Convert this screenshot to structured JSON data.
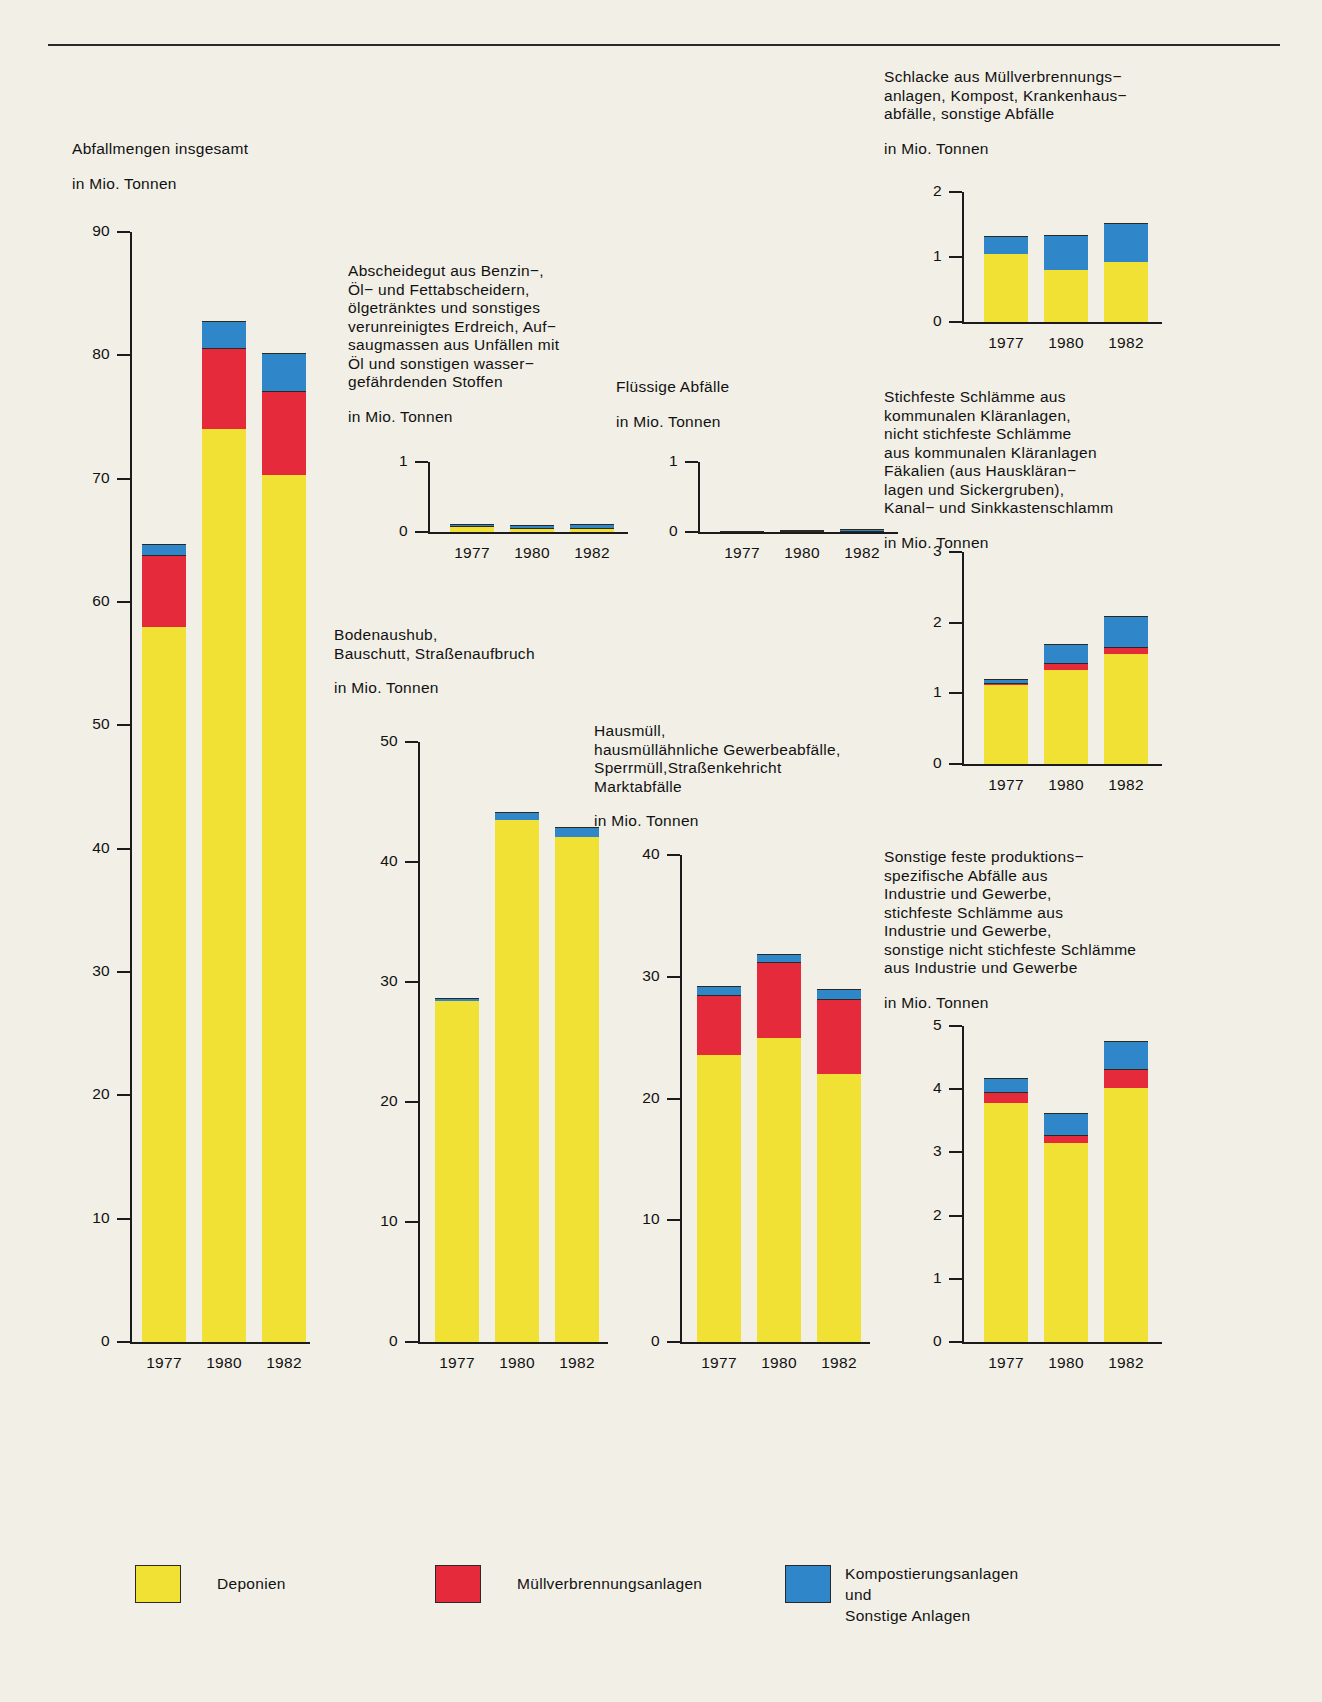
{
  "figure": {
    "unit_label": "in Mio. Tonnen",
    "years": [
      "1977",
      "1980",
      "1982"
    ]
  },
  "legend": {
    "items": [
      {
        "name": "deponien",
        "label": "Deponien",
        "color": "#f2e135"
      },
      {
        "name": "muellverbrennungsanlagen",
        "label": "Müllverbrennungsanlagen",
        "color": "#e42a3b"
      },
      {
        "name": "kompostierungsanlagen",
        "label": "Kompostierungsanlagen und\nSonstige Anlagen",
        "color": "#2f86c8"
      }
    ]
  },
  "chart_data": [
    {
      "id": "abfallmengen-insgesamt",
      "type": "bar",
      "stacked": true,
      "title": "Abfallmengen insgesamt",
      "ylabel": "in Mio. Tonnen",
      "categories": [
        "1977",
        "1980",
        "1982"
      ],
      "ylim": [
        0,
        90
      ],
      "yticks": [
        0,
        10,
        20,
        30,
        40,
        50,
        60,
        70,
        80,
        90
      ],
      "series": [
        {
          "name": "Deponien",
          "color": "#f2e135",
          "values": [
            58.0,
            74.0,
            70.3
          ]
        },
        {
          "name": "Müllverbrennungsanlagen",
          "color": "#e42a3b",
          "values": [
            5.8,
            6.6,
            6.8
          ]
        },
        {
          "name": "Kompostierungsanlagen und Sonstige Anlagen",
          "color": "#2f86c8",
          "values": [
            0.9,
            2.2,
            3.1
          ]
        }
      ],
      "totals": [
        64.7,
        82.8,
        80.2
      ]
    },
    {
      "id": "abscheidegut",
      "type": "bar",
      "stacked": true,
      "title": "Abscheidegut aus Benzin−,\nÖl− und Fettabscheidern,\nölgetränktes und sonstiges\nverunreinigtes Erdreich, Auf−\nsaugmassen aus Unfällen mit\nÖl und sonstigen wasser−\ngefährdenden Stoffen",
      "ylabel": "in Mio. Tonnen",
      "categories": [
        "1977",
        "1980",
        "1982"
      ],
      "ylim": [
        0,
        1
      ],
      "yticks": [
        0,
        1
      ],
      "series": [
        {
          "name": "Deponien",
          "color": "#f2e135",
          "values": [
            0.085,
            0.055,
            0.055
          ]
        },
        {
          "name": "Müllverbrennungsanlagen",
          "color": "#e42a3b",
          "values": [
            0.005,
            0.005,
            0.005
          ]
        },
        {
          "name": "Kompostierungsanlagen und Sonstige Anlagen",
          "color": "#2f86c8",
          "values": [
            0.02,
            0.04,
            0.05
          ]
        }
      ],
      "totals": [
        0.11,
        0.1,
        0.11
      ]
    },
    {
      "id": "fluessige-abfaelle",
      "type": "bar",
      "stacked": true,
      "title": "Flüssige Abfälle",
      "ylabel": "in Mio. Tonnen",
      "categories": [
        "1977",
        "1980",
        "1982"
      ],
      "ylim": [
        0,
        1
      ],
      "yticks": [
        0,
        1
      ],
      "series": [
        {
          "name": "Deponien",
          "color": "#f2e135",
          "values": [
            0.01,
            0.01,
            0.01
          ]
        },
        {
          "name": "Müllverbrennungsanlagen",
          "color": "#e42a3b",
          "values": [
            0.005,
            0.005,
            0.005
          ]
        },
        {
          "name": "Kompostierungsanlagen und Sonstige Anlagen",
          "color": "#2f86c8",
          "values": [
            0.005,
            0.01,
            0.03
          ]
        }
      ],
      "totals": [
        0.02,
        0.025,
        0.045
      ]
    },
    {
      "id": "schlacke-kompost-krankenhaus",
      "type": "bar",
      "stacked": true,
      "title": "Schlacke aus Müllverbrennungs−\nanlagen, Kompost, Krankenhaus−\nabfälle, sonstige Abfälle",
      "ylabel": "in Mio. Tonnen",
      "categories": [
        "1977",
        "1980",
        "1982"
      ],
      "ylim": [
        0,
        2
      ],
      "yticks": [
        0,
        1,
        2
      ],
      "series": [
        {
          "name": "Deponien",
          "color": "#f2e135",
          "values": [
            1.05,
            0.8,
            0.92
          ]
        },
        {
          "name": "Müllverbrennungsanlagen",
          "color": "#e42a3b",
          "values": [
            0.0,
            0.0,
            0.0
          ]
        },
        {
          "name": "Kompostierungsanlagen und Sonstige Anlagen",
          "color": "#2f86c8",
          "values": [
            0.28,
            0.54,
            0.6
          ]
        }
      ],
      "totals": [
        1.33,
        1.34,
        1.52
      ]
    },
    {
      "id": "stichfeste-schlaemme",
      "type": "bar",
      "stacked": true,
      "title": "Stichfeste Schlämme aus\nkommunalen Kläranlagen,\nnicht stichfeste Schlämme\naus kommunalen Kläranlagen\nFäkalien (aus Hauskläran−\nlagen und Sickergruben),\nKanal− und Sinkkastenschlamm",
      "ylabel": "in Mio. Tonnen",
      "categories": [
        "1977",
        "1980",
        "1982"
      ],
      "ylim": [
        0,
        3
      ],
      "yticks": [
        0,
        1,
        2,
        3
      ],
      "series": [
        {
          "name": "Deponien",
          "color": "#f2e135",
          "values": [
            1.12,
            1.33,
            1.56
          ]
        },
        {
          "name": "Müllverbrennungsanlagen",
          "color": "#e42a3b",
          "values": [
            0.02,
            0.1,
            0.1
          ]
        },
        {
          "name": "Kompostierungsanlagen und Sonstige Anlagen",
          "color": "#2f86c8",
          "values": [
            0.06,
            0.27,
            0.44
          ]
        }
      ],
      "totals": [
        1.2,
        1.7,
        2.1
      ]
    },
    {
      "id": "bodenaushub-bauschutt",
      "type": "bar",
      "stacked": true,
      "title": "Bodenaushub,\nBauschutt, Straßenaufbruch",
      "ylabel": "in Mio. Tonnen",
      "categories": [
        "1977",
        "1980",
        "1982"
      ],
      "ylim": [
        0,
        50
      ],
      "yticks": [
        0,
        10,
        20,
        30,
        40,
        50
      ],
      "series": [
        {
          "name": "Deponien",
          "color": "#f2e135",
          "values": [
            28.4,
            43.5,
            42.1
          ]
        },
        {
          "name": "Müllverbrennungsanlagen",
          "color": "#e42a3b",
          "values": [
            0.0,
            0.0,
            0.0
          ]
        },
        {
          "name": "Kompostierungsanlagen und Sonstige Anlagen",
          "color": "#2f86c8",
          "values": [
            0.3,
            0.7,
            0.8
          ]
        }
      ],
      "totals": [
        28.7,
        44.2,
        42.9
      ]
    },
    {
      "id": "hausmuell",
      "type": "bar",
      "stacked": true,
      "title": "Hausmüll,\nhausmüllähnliche Gewerbeabfälle,\nSperrmüll,Straßenkehricht\nMarktabfälle",
      "ylabel": "in Mio. Tonnen",
      "categories": [
        "1977",
        "1980",
        "1982"
      ],
      "ylim": [
        0,
        40
      ],
      "yticks": [
        0,
        10,
        20,
        30,
        40
      ],
      "series": [
        {
          "name": "Deponien",
          "color": "#f2e135",
          "values": [
            23.6,
            25.0,
            22.0
          ]
        },
        {
          "name": "Müllverbrennungsanlagen",
          "color": "#e42a3b",
          "values": [
            4.9,
            6.2,
            6.2
          ]
        },
        {
          "name": "Kompostierungsanlagen und Sonstige Anlagen",
          "color": "#2f86c8",
          "values": [
            0.7,
            0.7,
            0.8
          ]
        }
      ],
      "totals": [
        29.2,
        31.9,
        29.0
      ]
    },
    {
      "id": "sonstige-feste-produktionsspezifische",
      "type": "bar",
      "stacked": true,
      "title": "Sonstige feste produktions−\nspezifische Abfälle aus\nIndustrie und Gewerbe,\nstichfeste Schlämme aus\nIndustrie und Gewerbe,\nsonstige nicht stichfeste Schlämme\naus Industrie und Gewerbe",
      "ylabel": "in Mio. Tonnen",
      "categories": [
        "1977",
        "1980",
        "1982"
      ],
      "ylim": [
        0,
        5
      ],
      "yticks": [
        0,
        1,
        2,
        3,
        4,
        5
      ],
      "series": [
        {
          "name": "Deponien",
          "color": "#f2e135",
          "values": [
            3.78,
            3.15,
            4.02
          ]
        },
        {
          "name": "Müllverbrennungsanlagen",
          "color": "#e42a3b",
          "values": [
            0.18,
            0.12,
            0.3
          ]
        },
        {
          "name": "Kompostierungsanlagen und Sonstige Anlagen",
          "color": "#2f86c8",
          "values": [
            0.21,
            0.36,
            0.45
          ]
        }
      ],
      "totals": [
        4.17,
        3.63,
        4.77
      ]
    }
  ]
}
